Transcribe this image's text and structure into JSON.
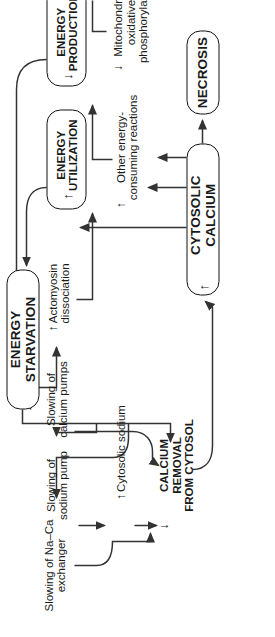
{
  "diagram": {
    "orientation": "rotated-90",
    "line_color": "#333333",
    "text_color": "#1a1a1a",
    "box_border_color": "#111111"
  },
  "nodes": {
    "energy_starvation": {
      "label": "ENERGY STARVATION",
      "marker": "",
      "style": "boxed"
    },
    "cytosolic_calcium": {
      "label": "CYTOSOLIC CALCIUM",
      "marker": "↑",
      "style": "boxed"
    },
    "necrosis": {
      "label": "NECROSIS",
      "marker": "",
      "style": "boxed"
    },
    "energy_utilization": {
      "label": "ENERGY\nUTILIZATION",
      "marker": "↑",
      "style": "boxed"
    },
    "energy_production": {
      "label": "ENERGY\nPRODUCTION",
      "marker": "↓",
      "style": "boxed"
    },
    "slowing_na_ca_exchanger": {
      "label": "Slowing of Na–Ca\nexchanger",
      "marker": "",
      "style": "plain"
    },
    "slowing_sodium_pump": {
      "label": "Slowing of\nsodium pump",
      "marker": "",
      "style": "plain"
    },
    "cytosolic_sodium": {
      "label": "Cytosolic sodium",
      "marker": "↑",
      "style": "plain"
    },
    "calcium_removal": {
      "label": "CALCIUM REMOVAL\nFROM CYTOSOL",
      "marker": "↓",
      "style": "plain-bold"
    },
    "slowing_calcium_pumps": {
      "label": "Slowing of\ncalcium pumps",
      "marker": "",
      "style": "plain"
    },
    "actomyosin_dissociation": {
      "label": "Actomyosin\ndissociation",
      "marker": "↑",
      "style": "plain"
    },
    "other_energy_consuming": {
      "label": "Other energy-\nconsuming reactions",
      "marker": "↑",
      "style": "plain"
    },
    "mitochondrial_oxphos": {
      "label": "Mitochondrial\noxidative\nphosphorylation",
      "marker": "↓",
      "style": "plain"
    }
  },
  "edges": [
    {
      "from": "energy_starvation",
      "to": "slowing_na_ca_exchanger"
    },
    {
      "from": "energy_starvation",
      "to": "slowing_sodium_pump"
    },
    {
      "from": "energy_starvation",
      "to": "slowing_calcium_pumps"
    },
    {
      "from": "energy_starvation",
      "to": "actomyosin_dissociation"
    },
    {
      "from": "slowing_sodium_pump",
      "to": "cytosolic_sodium"
    },
    {
      "from": "cytosolic_sodium",
      "to": "calcium_removal"
    },
    {
      "from": "slowing_na_ca_exchanger",
      "to": "calcium_removal"
    },
    {
      "from": "slowing_calcium_pumps",
      "to": "calcium_removal"
    },
    {
      "from": "calcium_removal",
      "to": "cytosolic_calcium"
    },
    {
      "from": "cytosolic_calcium",
      "to": "necrosis"
    },
    {
      "from": "cytosolic_calcium",
      "to": "actomyosin_dissociation"
    },
    {
      "from": "cytosolic_calcium",
      "to": "other_energy_consuming"
    },
    {
      "from": "cytosolic_calcium",
      "to": "mitochondrial_oxphos"
    },
    {
      "from": "other_energy_consuming",
      "to": "energy_utilization"
    },
    {
      "from": "mitochondrial_oxphos",
      "to": "energy_production"
    },
    {
      "from": "actomyosin_dissociation",
      "to": "energy_utilization"
    },
    {
      "from": "energy_utilization",
      "to": "energy_starvation"
    },
    {
      "from": "energy_production",
      "to": "energy_starvation"
    }
  ]
}
